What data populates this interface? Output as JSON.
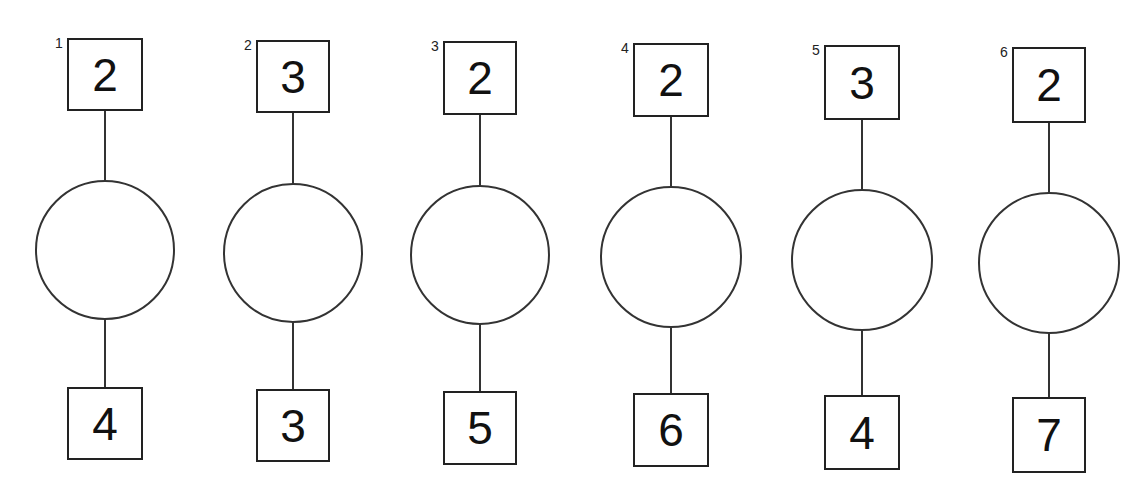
{
  "diagram": {
    "units": [
      {
        "index": "1",
        "top": "2",
        "bottom": "4",
        "geom": {
          "cx": 105,
          "boxTop": 38,
          "circleCy": 250,
          "r": 70,
          "bottomBoxTop": 387,
          "boxW": 76,
          "boxH": 73
        }
      },
      {
        "index": "2",
        "top": "3",
        "bottom": "3",
        "geom": {
          "cx": 293,
          "boxTop": 40,
          "circleCy": 253,
          "r": 70,
          "bottomBoxTop": 389,
          "boxW": 74,
          "boxH": 73
        }
      },
      {
        "index": "3",
        "top": "2",
        "bottom": "5",
        "geom": {
          "cx": 480,
          "boxTop": 41,
          "circleCy": 255,
          "r": 70,
          "bottomBoxTop": 391,
          "boxW": 74,
          "boxH": 74
        }
      },
      {
        "index": "4",
        "top": "2",
        "bottom": "6",
        "geom": {
          "cx": 671,
          "boxTop": 43,
          "circleCy": 257,
          "r": 71,
          "bottomBoxTop": 393,
          "boxW": 76,
          "boxH": 74
        }
      },
      {
        "index": "5",
        "top": "3",
        "bottom": "4",
        "geom": {
          "cx": 862,
          "boxTop": 45,
          "circleCy": 260,
          "r": 71,
          "bottomBoxTop": 395,
          "boxW": 76,
          "boxH": 75
        }
      },
      {
        "index": "6",
        "top": "2",
        "bottom": "7",
        "geom": {
          "cx": 1049,
          "boxTop": 47,
          "circleCy": 263,
          "r": 71,
          "bottomBoxTop": 397,
          "boxW": 74,
          "boxH": 76
        }
      }
    ]
  },
  "colors": {
    "stroke": "#333333",
    "text": "#111111",
    "background": "#ffffff"
  }
}
